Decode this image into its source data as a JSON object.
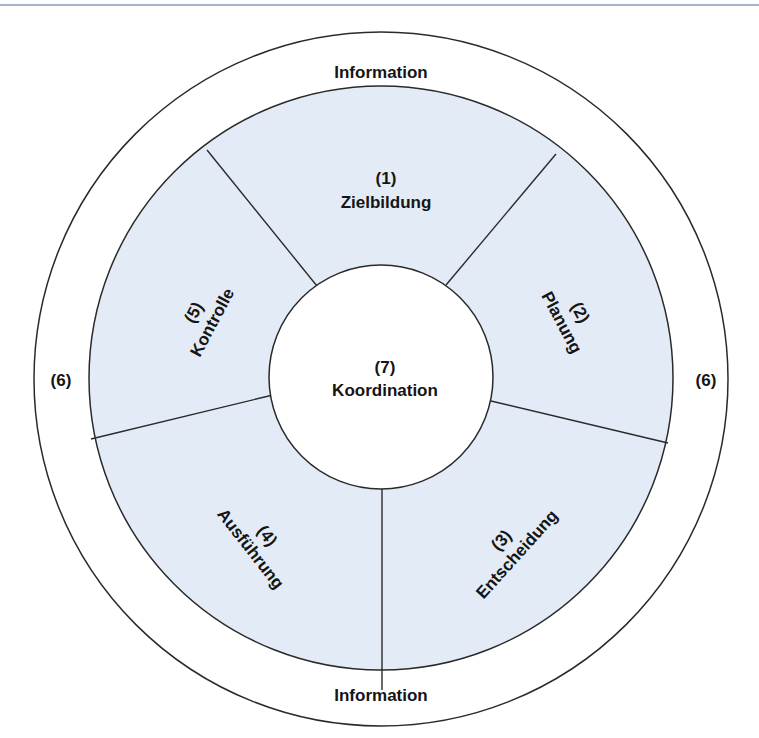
{
  "diagram": {
    "outer_ring": {
      "top_label": "Information",
      "bottom_label": "Information",
      "left_label": "(6)",
      "right_label": "(6)"
    },
    "center": {
      "number": "(7)",
      "label": "Koordination"
    },
    "segments": [
      {
        "number": "(1)",
        "label": "Zielbildung"
      },
      {
        "number": "(2)",
        "label": "Planung"
      },
      {
        "number": "(3)",
        "label": "Entscheidung"
      },
      {
        "number": "(4)",
        "label": "Ausführung"
      },
      {
        "number": "(5)",
        "label": "Kontrolle"
      }
    ],
    "colors": {
      "segment_fill": "#e3ecf6",
      "stroke": "#2a2a2a",
      "text": "#151515",
      "top_rule": "#a9b4c8"
    }
  }
}
